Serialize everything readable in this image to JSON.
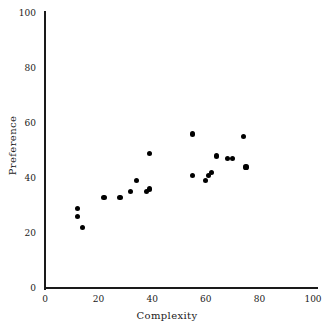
{
  "chart_data": {
    "type": "scatter",
    "title": "",
    "xlabel": "Complexity",
    "ylabel": "Preference",
    "xlim": [
      0,
      100
    ],
    "ylim": [
      0,
      100
    ],
    "xticks": [
      0,
      20,
      40,
      60,
      80,
      100
    ],
    "yticks": [
      0,
      20,
      40,
      60,
      80,
      100
    ],
    "xtick_labels": [
      "0",
      "20",
      "40",
      "60",
      "80",
      "100"
    ],
    "ytick_labels": [
      "0",
      "20",
      "40",
      "60",
      "80",
      "100"
    ],
    "grid": false,
    "legend": null,
    "marker": "filled-circle",
    "marker_color": "#000000",
    "axis_color": "#1a1a1a",
    "background_color": "#ffffff",
    "n_points": 20,
    "points": [
      {
        "x": 12,
        "y": 29
      },
      {
        "x": 12,
        "y": 26
      },
      {
        "x": 14,
        "y": 22
      },
      {
        "x": 22,
        "y": 33
      },
      {
        "x": 28,
        "y": 33
      },
      {
        "x": 32,
        "y": 35
      },
      {
        "x": 34,
        "y": 39
      },
      {
        "x": 38,
        "y": 35
      },
      {
        "x": 39,
        "y": 36
      },
      {
        "x": 39,
        "y": 49
      },
      {
        "x": 55,
        "y": 56
      },
      {
        "x": 55,
        "y": 41
      },
      {
        "x": 60,
        "y": 39
      },
      {
        "x": 61,
        "y": 41
      },
      {
        "x": 62,
        "y": 42
      },
      {
        "x": 64,
        "y": 48
      },
      {
        "x": 68,
        "y": 47
      },
      {
        "x": 70,
        "y": 47
      },
      {
        "x": 74,
        "y": 55
      },
      {
        "x": 75,
        "y": 44
      }
    ]
  }
}
